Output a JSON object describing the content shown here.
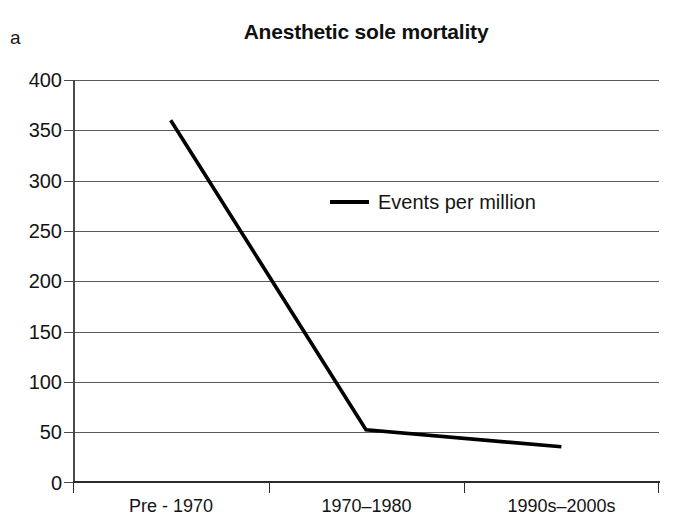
{
  "panel": {
    "label": "a"
  },
  "chart_data": {
    "type": "line",
    "title": "Anesthetic sole mortality",
    "xlabel": "",
    "ylabel": "",
    "categories": [
      "Pre - 1970",
      "1970–1980",
      "1990s–2000s"
    ],
    "series": [
      {
        "name": "Events per million",
        "values": [
          360,
          52,
          35
        ],
        "color": "#000000"
      }
    ],
    "ylim": [
      0,
      400
    ],
    "yticks": [
      0,
      50,
      100,
      150,
      200,
      250,
      300,
      350,
      400
    ],
    "ytick_labels": [
      "0",
      "50",
      "100",
      "150",
      "200",
      "250",
      "300",
      "350",
      "400"
    ],
    "grid": true,
    "grid_axis": "y",
    "legend": {
      "position": "inside-upper-center",
      "entries": [
        {
          "label": "Events per million",
          "marker": "line-swatch",
          "color": "#000000"
        }
      ]
    },
    "axis_color": "#2b2b2b",
    "grid_color": "#5a5a5a",
    "background": "#ffffff"
  }
}
